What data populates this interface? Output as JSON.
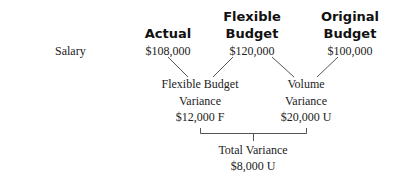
{
  "row_label": "Salary",
  "columns": [
    {
      "header_lines": [
        "Actual"
      ],
      "value": "$108,000"
    },
    {
      "header_lines": [
        "Flexible",
        "Budget"
      ],
      "value": "$120,000"
    },
    {
      "header_lines": [
        "Original",
        "Budget"
      ],
      "value": "$100,000"
    }
  ],
  "variances": [
    {
      "label_lines": [
        "Flexible Budget",
        "Variance"
      ],
      "value": "$12,000 F"
    },
    {
      "label_lines": [
        "Volume",
        "Variance"
      ],
      "value": "$20,000 U"
    }
  ],
  "total": {
    "label": "Total Variance",
    "value": "$8,000 U"
  },
  "colors": {
    "text": "#222222",
    "lines": "#555555"
  }
}
